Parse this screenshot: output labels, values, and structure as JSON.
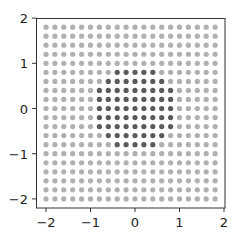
{
  "chart_data": {
    "type": "scatter",
    "title": "",
    "xlabel": "",
    "ylabel": "",
    "xlim": [
      -2.22,
      2.0
    ],
    "ylim": [
      -2.2,
      2.0
    ],
    "grid": false,
    "legend": null,
    "x_ticks": [
      -2,
      -1,
      0,
      1,
      2
    ],
    "y_ticks": [
      -2,
      -1,
      0,
      1,
      2
    ],
    "x_tick_labels": [
      "−2",
      "−1",
      "0",
      "1",
      "2"
    ],
    "y_tick_labels": [
      "−2",
      "−1",
      "0",
      "1",
      "2"
    ],
    "grid_points": {
      "x_start": -2.0,
      "x_end": 1.8,
      "y_start": -2.0,
      "y_end": 1.8,
      "step": 0.2,
      "count_per_axis": 20
    },
    "series": [
      {
        "name": "all grid points (outside unit circle)",
        "rule": "x^2 + y^2 >= 1",
        "color": "#b0b0b0"
      },
      {
        "name": "points inside unit circle",
        "rule": "x^2 + y^2 < 1",
        "color": "#5a5a5a",
        "rows": [
          {
            "y": 0.8,
            "x": [
              -0.4,
              -0.2,
              0.0,
              0.2,
              0.4
            ]
          },
          {
            "y": 0.6,
            "x": [
              -0.6,
              -0.4,
              -0.2,
              0.0,
              0.2,
              0.4,
              0.6
            ]
          },
          {
            "y": 0.4,
            "x": [
              -0.8,
              -0.6,
              -0.4,
              -0.2,
              0.0,
              0.2,
              0.4,
              0.6,
              0.8
            ]
          },
          {
            "y": 0.2,
            "x": [
              -0.8,
              -0.6,
              -0.4,
              -0.2,
              0.0,
              0.2,
              0.4,
              0.6,
              0.8
            ]
          },
          {
            "y": 0.0,
            "x": [
              -0.8,
              -0.6,
              -0.4,
              -0.2,
              0.0,
              0.2,
              0.4,
              0.6,
              0.8
            ]
          },
          {
            "y": -0.2,
            "x": [
              -0.8,
              -0.6,
              -0.4,
              -0.2,
              0.0,
              0.2,
              0.4,
              0.6,
              0.8
            ]
          },
          {
            "y": -0.4,
            "x": [
              -0.8,
              -0.6,
              -0.4,
              -0.2,
              0.0,
              0.2,
              0.4,
              0.6,
              0.8
            ]
          },
          {
            "y": -0.6,
            "x": [
              -0.6,
              -0.4,
              -0.2,
              0.0,
              0.2,
              0.4,
              0.6
            ]
          },
          {
            "y": -0.8,
            "x": [
              -0.4,
              -0.2,
              0.0,
              0.2,
              0.4
            ]
          }
        ]
      }
    ],
    "marker_radius_px": 2.6,
    "colors": {
      "axis": "#333333",
      "light_point": "#b0b0b0",
      "dark_point": "#5a5a5a"
    }
  }
}
